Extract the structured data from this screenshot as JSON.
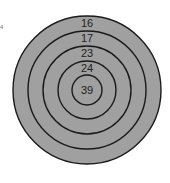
{
  "diagram": {
    "type": "concentric-circles",
    "fill_color": "#a0a0a0",
    "line_color": "#1a1a1a",
    "background": "#ffffff",
    "edge_mark": "4",
    "rings": [
      {
        "label": "16",
        "radius": 74
      },
      {
        "label": "17",
        "radius": 59
      },
      {
        "label": "23",
        "radius": 44
      },
      {
        "label": "24",
        "radius": 29
      },
      {
        "label": "39",
        "radius": 15
      }
    ]
  }
}
